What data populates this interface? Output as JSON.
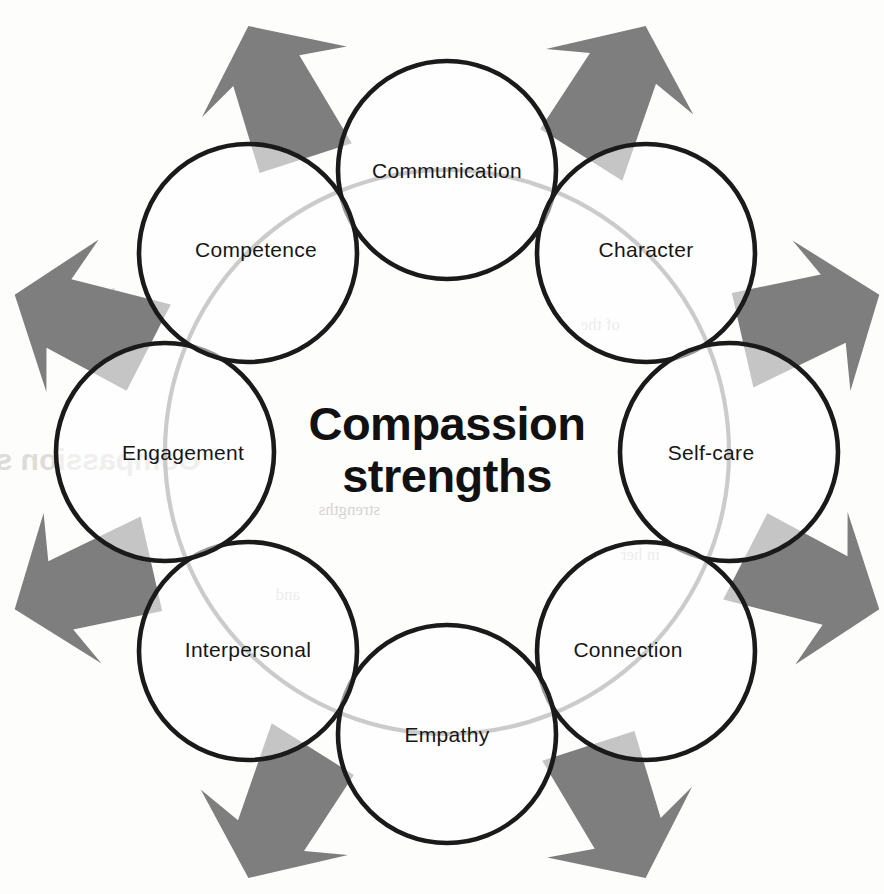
{
  "diagram": {
    "type": "radial-circle-cluster",
    "title_lines": [
      "Compassion",
      "strengths"
    ],
    "center_label": "Compassion strengths",
    "geometry": {
      "canvas_width": 884,
      "canvas_height": 894,
      "cluster_center_x": 447,
      "cluster_center_y": 452,
      "ring_radius": 282,
      "node_radius": 109,
      "node_count": 8
    },
    "colors": {
      "background": "#fdfdfc",
      "circle_outline": "#1a1a1a",
      "inner_ring": "#8d8d8d",
      "arrow_fill": "#7e7e7e",
      "label_text": "#161616",
      "title_text": "#111111"
    },
    "nodes": [
      {
        "label": "Communication",
        "angle_deg": -90,
        "cx": 447,
        "cy": 170,
        "label_dx": 0,
        "label_dy": 8
      },
      {
        "label": "Character",
        "angle_deg": -45,
        "cx": 646,
        "cy": 253,
        "label_dx": 0,
        "label_dy": 4
      },
      {
        "label": "Self-care",
        "angle_deg": 0,
        "cx": 729,
        "cy": 452,
        "label_dx": -18,
        "label_dy": 8
      },
      {
        "label": "Connection",
        "angle_deg": 45,
        "cx": 646,
        "cy": 651,
        "label_dx": -18,
        "label_dy": 6
      },
      {
        "label": "Empathy",
        "angle_deg": 90,
        "cx": 447,
        "cy": 734,
        "label_dx": 0,
        "label_dy": 8
      },
      {
        "label": "Interpersonal",
        "angle_deg": 135,
        "cx": 248,
        "cy": 651,
        "label_dx": 0,
        "label_dy": 6
      },
      {
        "label": "Engagement",
        "angle_deg": 180,
        "cx": 165,
        "cy": 452,
        "label_dx": 18,
        "label_dy": 8
      },
      {
        "label": "Competence",
        "angle_deg": -135,
        "cx": 248,
        "cy": 253,
        "label_dx": 8,
        "label_dy": 4
      }
    ],
    "arrows": [
      {
        "name": "arrow-up-left",
        "direction": "up-left",
        "angle_deg": -115,
        "distance": 395
      },
      {
        "name": "arrow-up-right",
        "direction": "up-right",
        "angle_deg": -65,
        "distance": 395
      },
      {
        "name": "arrow-left-upper",
        "direction": "left",
        "angle_deg": -160,
        "distance": 385
      },
      {
        "name": "arrow-right-upper",
        "direction": "right",
        "angle_deg": -20,
        "distance": 385
      },
      {
        "name": "arrow-left-lower",
        "direction": "down-left",
        "angle_deg": 160,
        "distance": 385
      },
      {
        "name": "arrow-right-lower",
        "direction": "down-right",
        "angle_deg": 20,
        "distance": 385
      },
      {
        "name": "arrow-down-left",
        "direction": "down-left",
        "angle_deg": 115,
        "distance": 395
      },
      {
        "name": "arrow-down-right",
        "direction": "down-right",
        "angle_deg": 65,
        "distance": 395
      }
    ],
    "ghost_marks": [
      {
        "text": "\"Compassion strengths\"",
        "x": 215,
        "y": 470
      },
      {
        "text": "the of",
        "x": 120,
        "y": 300
      },
      {
        "text": "will",
        "x": 140,
        "y": 540
      },
      {
        "text": "and",
        "x": 300,
        "y": 600
      },
      {
        "text": "of the",
        "x": 620,
        "y": 330
      },
      {
        "text": "in her",
        "x": 660,
        "y": 560
      },
      {
        "text": "strengths",
        "x": 380,
        "y": 515
      }
    ]
  }
}
